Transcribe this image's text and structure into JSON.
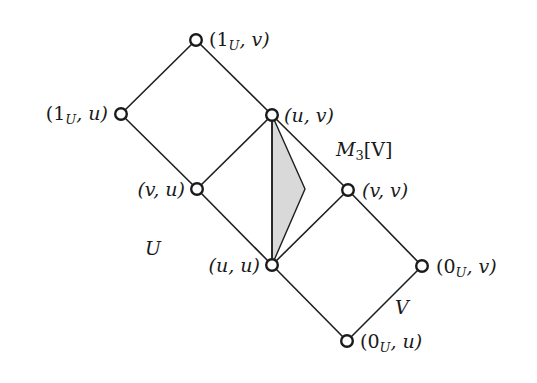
{
  "diagram": {
    "nodes": [
      {
        "id": "1U_v",
        "label_open": "(",
        "label_main": "1",
        "label_sub": "U",
        "label_rest": ", v)",
        "x": 196,
        "y": 40
      },
      {
        "id": "1U_u",
        "label_open": "(",
        "label_main": "1",
        "label_sub": "U",
        "label_rest": ", u)",
        "x": 121,
        "y": 114
      },
      {
        "id": "u_v",
        "label": "(u, v)",
        "x": 272,
        "y": 115
      },
      {
        "id": "v_u",
        "label": "(v, u)",
        "x": 197,
        "y": 189
      },
      {
        "id": "v_v",
        "label": "(v, v)",
        "x": 348,
        "y": 190
      },
      {
        "id": "u_u",
        "label": "(u, u)",
        "x": 272,
        "y": 265
      },
      {
        "id": "0U_v",
        "label_open": "(",
        "label_main": "0",
        "label_sub": "U",
        "label_rest": ", v)",
        "x": 422,
        "y": 266
      },
      {
        "id": "0U_u",
        "label_open": "(",
        "label_main": "0",
        "label_sub": "U",
        "label_rest": ", u)",
        "x": 347,
        "y": 341
      }
    ],
    "edges": [
      [
        "1U_v",
        "1U_u"
      ],
      [
        "1U_v",
        "u_v"
      ],
      [
        "1U_u",
        "v_u"
      ],
      [
        "u_v",
        "v_u"
      ],
      [
        "u_v",
        "v_v"
      ],
      [
        "u_v",
        "u_u"
      ],
      [
        "v_u",
        "u_u"
      ],
      [
        "v_v",
        "u_u"
      ],
      [
        "v_v",
        "0U_v"
      ],
      [
        "u_u",
        "0U_u"
      ],
      [
        "0U_v",
        "0U_u"
      ]
    ],
    "shaded_region": {
      "color": "#d9d9d9",
      "apex_x": 305,
      "apex_y": 189
    },
    "region_labels": {
      "m3v_main": "M",
      "m3v_sub": "3",
      "m3v_rest": "[V]",
      "u": "U",
      "v": "V"
    }
  }
}
